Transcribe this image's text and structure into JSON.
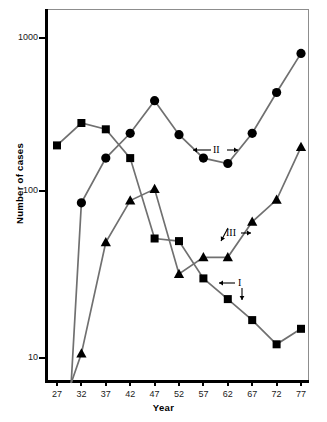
{
  "chart_data": {
    "type": "line",
    "title": "",
    "xlabel": "Year",
    "ylabel": "Number of cases",
    "yscale": "log",
    "ylim": [
      7,
      1400
    ],
    "xlim": [
      25,
      79
    ],
    "grid": false,
    "legend_position": "inline-annotations",
    "x": [
      27,
      32,
      37,
      42,
      47,
      52,
      57,
      62,
      67,
      72,
      77
    ],
    "ytick_labels": [
      "1000",
      "100",
      "10"
    ],
    "ytick_values": [
      1000,
      100,
      10
    ],
    "xtick_labels": [
      "27",
      "32",
      "37",
      "42",
      "47",
      "52",
      "57",
      "62",
      "67",
      "72",
      "77"
    ],
    "series": [
      {
        "name": "I",
        "marker": "square",
        "values": [
          210,
          290,
          265,
          175,
          55,
          53,
          31,
          23,
          17,
          12,
          15
        ]
      },
      {
        "name": "II",
        "marker": "circle",
        "values": [
          null,
          92,
          175,
          250,
          400,
          245,
          175,
          162,
          250,
          450,
          790
        ]
      },
      {
        "name": "III",
        "marker": "triangle",
        "values": [
          null,
          10.5,
          52,
          95,
          112,
          33,
          42,
          42,
          70,
          96,
          205
        ]
      }
    ],
    "annotations": [
      {
        "id": "ann-II",
        "label": "II",
        "x": 57.6,
        "y": 205,
        "arrows": "left-right"
      },
      {
        "id": "ann-III",
        "label": "III",
        "x": 60.5,
        "y": 57,
        "arrows": "down-left-right"
      },
      {
        "id": "ann-I",
        "label": "I",
        "x": 61.0,
        "y": 30,
        "arrows": "left-down"
      }
    ]
  },
  "axes": {
    "y_title": "Number of cases",
    "x_title": "Year"
  },
  "caption": {
    "text": ""
  }
}
